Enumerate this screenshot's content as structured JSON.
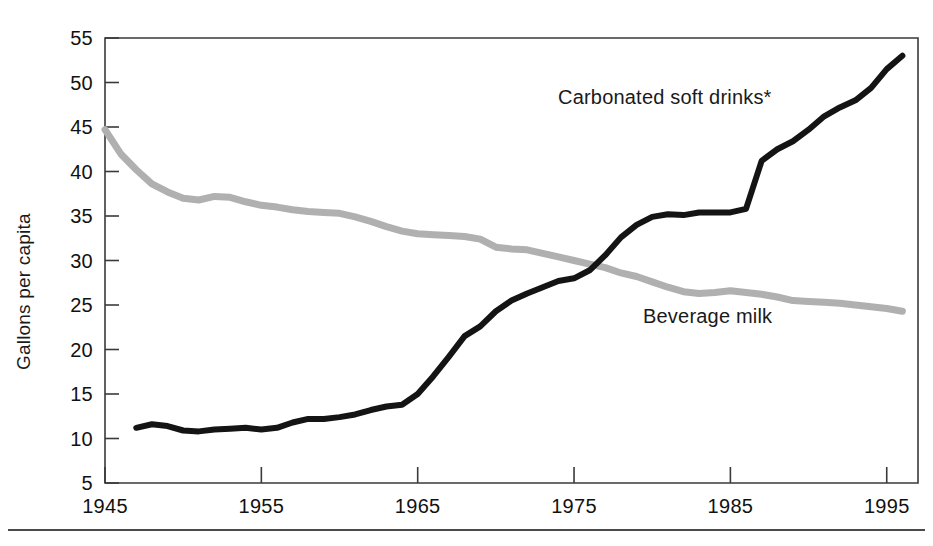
{
  "chart_data": {
    "type": "line",
    "title": "",
    "subtitle": "",
    "xlabel": "",
    "ylabel": "Gallons per capita",
    "xlim": [
      1945,
      1997
    ],
    "ylim": [
      5,
      55
    ],
    "grid": false,
    "legend_position": "inline-annotation",
    "x_ticks": [
      "1945",
      "1955",
      "1965",
      "1975",
      "1985",
      "1995"
    ],
    "x_tick_values": [
      1945,
      1955,
      1965,
      1975,
      1985,
      1995
    ],
    "y_ticks": [
      "5",
      "10",
      "15",
      "20",
      "25",
      "30",
      "35",
      "40",
      "45",
      "50",
      "55"
    ],
    "y_tick_values": [
      5,
      10,
      15,
      20,
      25,
      30,
      35,
      40,
      45,
      50,
      55
    ],
    "annotations": [
      {
        "name": "carbonated-soft-drinks-label",
        "text": "Carbonated soft drinks*",
        "x_px": 558,
        "y_px": 104,
        "anchor": "start"
      },
      {
        "name": "beverage-milk-label",
        "text": "Beverage milk",
        "x_px": 643,
        "y_px": 323,
        "anchor": "start"
      }
    ],
    "series": [
      {
        "name": "Beverage milk",
        "color": "#b0b0b0",
        "stroke_width": 7,
        "x": [
          1945,
          1946,
          1947,
          1948,
          1949,
          1950,
          1951,
          1952,
          1953,
          1954,
          1955,
          1956,
          1957,
          1958,
          1959,
          1960,
          1961,
          1962,
          1963,
          1964,
          1965,
          1966,
          1967,
          1968,
          1969,
          1970,
          1971,
          1972,
          1973,
          1974,
          1975,
          1976,
          1977,
          1978,
          1979,
          1980,
          1981,
          1982,
          1983,
          1984,
          1985,
          1986,
          1987,
          1988,
          1989,
          1990,
          1991,
          1992,
          1993,
          1994,
          1995,
          1996
        ],
        "values": [
          44.7,
          42.0,
          40.2,
          38.6,
          37.7,
          37.0,
          36.8,
          37.2,
          37.1,
          36.6,
          36.2,
          36.0,
          35.7,
          35.5,
          35.4,
          35.3,
          34.9,
          34.4,
          33.8,
          33.3,
          33.0,
          32.9,
          32.8,
          32.7,
          32.4,
          31.5,
          31.3,
          31.2,
          30.8,
          30.4,
          30.0,
          29.6,
          29.2,
          28.6,
          28.2,
          27.6,
          27.0,
          26.5,
          26.3,
          26.4,
          26.6,
          26.4,
          26.2,
          25.9,
          25.5,
          25.4,
          25.3,
          25.2,
          25.0,
          24.8,
          24.6,
          24.3
        ]
      },
      {
        "name": "Carbonated soft drinks*",
        "color": "#141414",
        "stroke_width": 6,
        "x": [
          1947,
          1948,
          1949,
          1950,
          1951,
          1952,
          1953,
          1954,
          1955,
          1956,
          1957,
          1958,
          1959,
          1960,
          1961,
          1962,
          1963,
          1964,
          1965,
          1966,
          1967,
          1968,
          1969,
          1970,
          1971,
          1972,
          1973,
          1974,
          1975,
          1976,
          1977,
          1978,
          1979,
          1980,
          1981,
          1982,
          1983,
          1984,
          1985,
          1986,
          1987,
          1988,
          1989,
          1990,
          1991,
          1992,
          1993,
          1994,
          1995,
          1996
        ],
        "values": [
          11.2,
          11.6,
          11.4,
          10.9,
          10.8,
          11.0,
          11.1,
          11.2,
          11.0,
          11.2,
          11.8,
          12.2,
          12.2,
          12.4,
          12.7,
          13.2,
          13.6,
          13.8,
          15.0,
          17.0,
          19.2,
          21.5,
          22.6,
          24.3,
          25.5,
          26.3,
          27.0,
          27.7,
          28.0,
          28.9,
          30.6,
          32.6,
          34.0,
          34.9,
          35.2,
          35.1,
          35.4,
          35.4,
          35.4,
          35.8,
          41.2,
          42.5,
          43.4,
          44.7,
          46.2,
          47.2,
          48.0,
          49.4,
          51.5,
          53.0
        ]
      }
    ]
  },
  "footer": {
    "rule_visible": true
  }
}
